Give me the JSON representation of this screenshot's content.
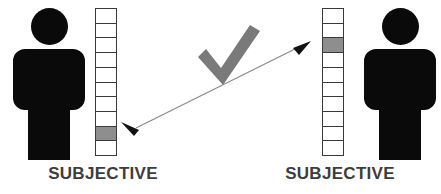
{
  "diagram": {
    "canvas": {
      "width": 441,
      "height": 194,
      "background": "#ffffff"
    },
    "colors": {
      "figure": "#0a0a0a",
      "scale_border": "#3a3a3a",
      "scale_empty": "#ffffff",
      "scale_filled": "#8e8e8e",
      "checkmark": "#7a7a7a",
      "arrow": "#8a8a8a",
      "arrowhead": "#111111",
      "label_text": "#3d3d3d"
    },
    "sides": [
      {
        "id": "left",
        "person_label": "person-figure",
        "scale": {
          "name": "left-rating-scale",
          "total_cells": 10,
          "filled_cell_from_top": 9,
          "filled_cell_from_bottom": 2,
          "cells": [
            "empty",
            "empty",
            "empty",
            "empty",
            "empty",
            "empty",
            "empty",
            "empty",
            "filled",
            "empty"
          ]
        },
        "label": "SUBJECTIVE"
      },
      {
        "id": "right",
        "person_label": "person-figure",
        "scale": {
          "name": "right-rating-scale",
          "total_cells": 10,
          "filled_cell_from_top": 3,
          "filled_cell_from_bottom": 8,
          "cells": [
            "empty",
            "empty",
            "filled",
            "empty",
            "empty",
            "empty",
            "empty",
            "empty",
            "empty",
            "empty"
          ]
        },
        "label": "SUBJECTIVE"
      }
    ],
    "center_symbol": {
      "name": "checkmark-icon",
      "meaning": "valid-comparison",
      "color": "#7a7a7a"
    },
    "connector": {
      "name": "double-headed-arrow",
      "style": "thin line with solid triangular arrowheads at both ends",
      "from": {
        "x": 131,
        "y": 128
      },
      "to": {
        "x": 301,
        "y": 47
      },
      "heads": "both"
    }
  }
}
